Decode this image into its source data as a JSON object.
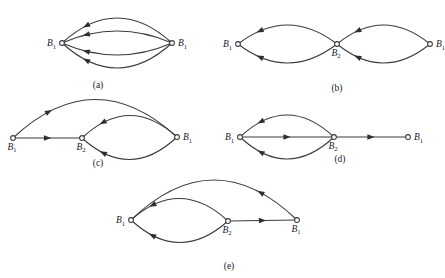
{
  "figure": {
    "title": "",
    "node_label_base": "B",
    "stroke_color": "#3a3a42",
    "node_fill": "#ffffff",
    "background": "#ffffff"
  },
  "panels": [
    {
      "id": "a",
      "caption": "(a)",
      "nodes": [
        {
          "name": "left",
          "label": "B",
          "sub": "1",
          "x": 62,
          "y": 43,
          "label_side": "left"
        },
        {
          "name": "right",
          "label": "B",
          "sub": "1",
          "x": 172,
          "y": 43,
          "label_side": "right"
        }
      ],
      "edges": [
        {
          "name": "arc-1",
          "from": "left",
          "to": "right",
          "shape": "arc",
          "bow": -25,
          "arrow_dir": "left"
        },
        {
          "name": "arc-2",
          "from": "left",
          "to": "right",
          "shape": "arc",
          "bow": -12,
          "arrow_dir": "left"
        },
        {
          "name": "arc-3",
          "from": "left",
          "to": "right",
          "shape": "arc",
          "bow": 12,
          "arrow_dir": "left"
        },
        {
          "name": "arc-4",
          "from": "left",
          "to": "right",
          "shape": "arc",
          "bow": 25,
          "arrow_dir": "left"
        }
      ]
    },
    {
      "id": "b",
      "caption": "(b)",
      "nodes": [
        {
          "name": "left",
          "label": "B",
          "sub": "1",
          "x": 238,
          "y": 44,
          "label_side": "left"
        },
        {
          "name": "mid",
          "label": "B",
          "sub": "2",
          "x": 337,
          "y": 44,
          "label_side": "below"
        },
        {
          "name": "right",
          "label": "B",
          "sub": "1",
          "x": 430,
          "y": 44,
          "label_side": "right"
        }
      ],
      "edges": [
        {
          "name": "left-loop-top",
          "from": "left",
          "to": "mid",
          "shape": "arc",
          "bow": -19,
          "arrow_dir": "left"
        },
        {
          "name": "left-loop-bottom",
          "from": "left",
          "to": "mid",
          "shape": "arc",
          "bow": 19,
          "arrow_dir": "left"
        },
        {
          "name": "right-loop-top",
          "from": "mid",
          "to": "right",
          "shape": "arc",
          "bow": -19,
          "arrow_dir": "left"
        },
        {
          "name": "right-loop-bottom",
          "from": "mid",
          "to": "right",
          "shape": "arc",
          "bow": 19,
          "arrow_dir": "left"
        }
      ]
    },
    {
      "id": "c",
      "caption": "(c)",
      "nodes": [
        {
          "name": "left",
          "label": "B",
          "sub": "1",
          "x": 13,
          "y": 138,
          "label_side": "below"
        },
        {
          "name": "mid",
          "label": "B",
          "sub": "2",
          "x": 82,
          "y": 138,
          "label_side": "below"
        },
        {
          "name": "right",
          "label": "B",
          "sub": "1",
          "x": 177,
          "y": 137,
          "label_side": "right"
        }
      ],
      "edges": [
        {
          "name": "outer-arc",
          "from": "left",
          "to": "right",
          "shape": "arc",
          "bow": -38,
          "arrow_dir": "right"
        },
        {
          "name": "straight",
          "from": "left",
          "to": "mid",
          "shape": "line",
          "arrow_dir": "right"
        },
        {
          "name": "loop-top",
          "from": "mid",
          "to": "right",
          "shape": "arc",
          "bow": -22,
          "arrow_dir": "left"
        },
        {
          "name": "loop-bottom",
          "from": "mid",
          "to": "right",
          "shape": "arc",
          "bow": 22,
          "arrow_dir": "left"
        }
      ]
    },
    {
      "id": "d",
      "caption": "(d)",
      "nodes": [
        {
          "name": "left",
          "label": "B",
          "sub": "1",
          "x": 240,
          "y": 137,
          "label_side": "left"
        },
        {
          "name": "mid",
          "label": "B",
          "sub": "2",
          "x": 334,
          "y": 137,
          "label_side": "below"
        },
        {
          "name": "right",
          "label": "B",
          "sub": "1",
          "x": 408,
          "y": 137,
          "label_side": "right"
        }
      ],
      "edges": [
        {
          "name": "loop-top",
          "from": "left",
          "to": "mid",
          "shape": "arc",
          "bow": -22,
          "arrow_dir": "left"
        },
        {
          "name": "loop-bottom",
          "from": "left",
          "to": "mid",
          "shape": "arc",
          "bow": 22,
          "arrow_dir": "left"
        },
        {
          "name": "straight-left",
          "from": "left",
          "to": "mid",
          "shape": "line",
          "arrow_dir": "right"
        },
        {
          "name": "straight-right",
          "from": "mid",
          "to": "right",
          "shape": "line",
          "arrow_dir": "right"
        }
      ]
    },
    {
      "id": "e",
      "caption": "(e)",
      "nodes": [
        {
          "name": "left",
          "label": "B",
          "sub": "1",
          "x": 131,
          "y": 220,
          "label_side": "left"
        },
        {
          "name": "mid",
          "label": "B",
          "sub": "2",
          "x": 228,
          "y": 221,
          "label_side": "below"
        },
        {
          "name": "right",
          "label": "B",
          "sub": "1",
          "x": 297,
          "y": 220,
          "label_side": "below"
        }
      ],
      "edges": [
        {
          "name": "outer-arc",
          "from": "right",
          "to": "left",
          "shape": "arc",
          "bow": 40,
          "arrow_dir": "left"
        },
        {
          "name": "loop-top",
          "from": "left",
          "to": "mid",
          "shape": "arc",
          "bow": -22,
          "arrow_dir": "left"
        },
        {
          "name": "loop-bottom",
          "from": "left",
          "to": "mid",
          "shape": "arc",
          "bow": 22,
          "arrow_dir": "left"
        },
        {
          "name": "straight",
          "from": "mid",
          "to": "right",
          "shape": "line",
          "arrow_dir": "right"
        }
      ]
    }
  ],
  "captions": {
    "a": "(a)",
    "b": "(b)",
    "c": "(c)",
    "d": "(d)",
    "e": "(e)"
  },
  "caption_positions": [
    {
      "id": "a",
      "x": 98,
      "y": 88
    },
    {
      "id": "b",
      "x": 337,
      "y": 91
    },
    {
      "id": "c",
      "x": 98,
      "y": 166
    },
    {
      "id": "d",
      "x": 340,
      "y": 162
    },
    {
      "id": "e",
      "x": 229,
      "y": 269
    }
  ]
}
